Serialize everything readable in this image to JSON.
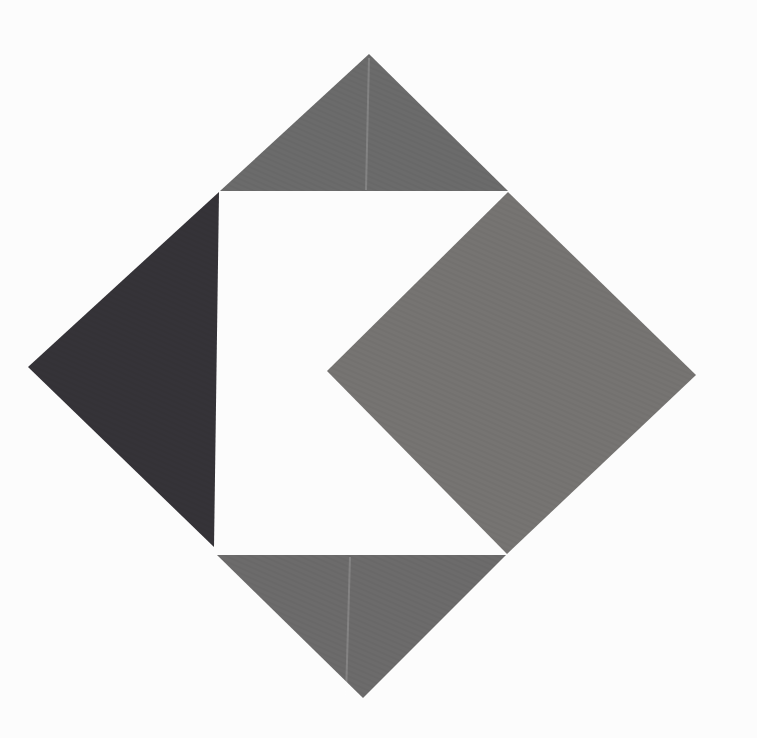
{
  "figure": {
    "canvas": {
      "width": 757,
      "height": 738
    },
    "background_color": "#fcfcfc",
    "shapes": [
      {
        "name": "top-gray-triangle",
        "type": "triangle",
        "color": "#6b6b6b",
        "points": [
          [
            369,
            54
          ],
          [
            508,
            191
          ],
          [
            220,
            191
          ]
        ]
      },
      {
        "name": "left-dark-triangle",
        "type": "triangle",
        "color": "#353338",
        "points": [
          [
            219,
            192
          ],
          [
            28,
            367
          ],
          [
            214,
            547
          ]
        ]
      },
      {
        "name": "right-gray-diamond",
        "type": "diamond",
        "color": "#767472",
        "points": [
          [
            508,
            192
          ],
          [
            696,
            375
          ],
          [
            507,
            554
          ],
          [
            327,
            371
          ]
        ]
      },
      {
        "name": "bottom-gray-triangle",
        "type": "triangle",
        "color": "#6c6b6b",
        "points": [
          [
            217,
            555
          ],
          [
            506,
            555
          ],
          [
            363,
            698
          ]
        ]
      }
    ],
    "artifacts": [
      {
        "name": "fold-line-top",
        "from": [
          369,
          58
        ],
        "to": [
          366,
          190
        ],
        "color": "#ffffff",
        "opacity": 0.16,
        "width": 2
      },
      {
        "name": "fold-line-bottom",
        "from": [
          350,
          557
        ],
        "to": [
          346,
          696
        ],
        "color": "#ffffff",
        "opacity": 0.16,
        "width": 2
      }
    ],
    "texture": {
      "name": "print-halftone",
      "line_color": "#000000",
      "opacity": 0.055,
      "spacing": 5,
      "angle": 24
    }
  }
}
